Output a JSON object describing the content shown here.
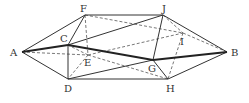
{
  "diagram": {
    "type": "geometry-solid",
    "points": {
      "A": {
        "x": 22,
        "y": 52,
        "label": "A",
        "lx": 10,
        "ly": 56
      },
      "F": {
        "x": 85,
        "y": 15,
        "label": "F",
        "lx": 80,
        "ly": 12
      },
      "C": {
        "x": 68,
        "y": 45,
        "label": "C",
        "lx": 60,
        "ly": 42
      },
      "E": {
        "x": 88,
        "y": 55,
        "label": "E",
        "lx": 84,
        "ly": 66
      },
      "D": {
        "x": 68,
        "y": 79,
        "label": "D",
        "lx": 64,
        "ly": 92
      },
      "J": {
        "x": 163,
        "y": 15,
        "label": "J",
        "lx": 162,
        "ly": 12
      },
      "I": {
        "x": 183,
        "y": 33,
        "label": "I",
        "lx": 180,
        "ly": 45
      },
      "B": {
        "x": 227,
        "y": 52,
        "label": "B",
        "lx": 231,
        "ly": 56
      },
      "G": {
        "x": 153,
        "y": 60,
        "label": "G",
        "lx": 148,
        "ly": 72
      },
      "H": {
        "x": 168,
        "y": 79,
        "label": "H",
        "lx": 166,
        "ly": 92
      }
    },
    "labels": {
      "A": "A",
      "B": "B",
      "C": "C",
      "D": "D",
      "E": "E",
      "F": "F",
      "G": "G",
      "H": "H",
      "I": "I",
      "J": "J"
    },
    "thick_edges": [
      [
        "A",
        "C"
      ],
      [
        "C",
        "G"
      ],
      [
        "G",
        "B"
      ]
    ],
    "solid_edges": [
      [
        "A",
        "F"
      ],
      [
        "A",
        "D"
      ],
      [
        "F",
        "J"
      ],
      [
        "D",
        "H"
      ],
      [
        "J",
        "B"
      ],
      [
        "H",
        "B"
      ],
      [
        "C",
        "F"
      ],
      [
        "C",
        "D"
      ],
      [
        "C",
        "J"
      ],
      [
        "D",
        "G"
      ],
      [
        "G",
        "J"
      ],
      [
        "G",
        "H"
      ]
    ],
    "dashed_edges": [
      [
        "A",
        "E"
      ],
      [
        "F",
        "E"
      ],
      [
        "E",
        "D"
      ],
      [
        "E",
        "H"
      ],
      [
        "F",
        "I"
      ],
      [
        "E",
        "I"
      ],
      [
        "J",
        "I"
      ],
      [
        "I",
        "H"
      ],
      [
        "I",
        "B"
      ],
      [
        "E",
        "C"
      ]
    ]
  }
}
